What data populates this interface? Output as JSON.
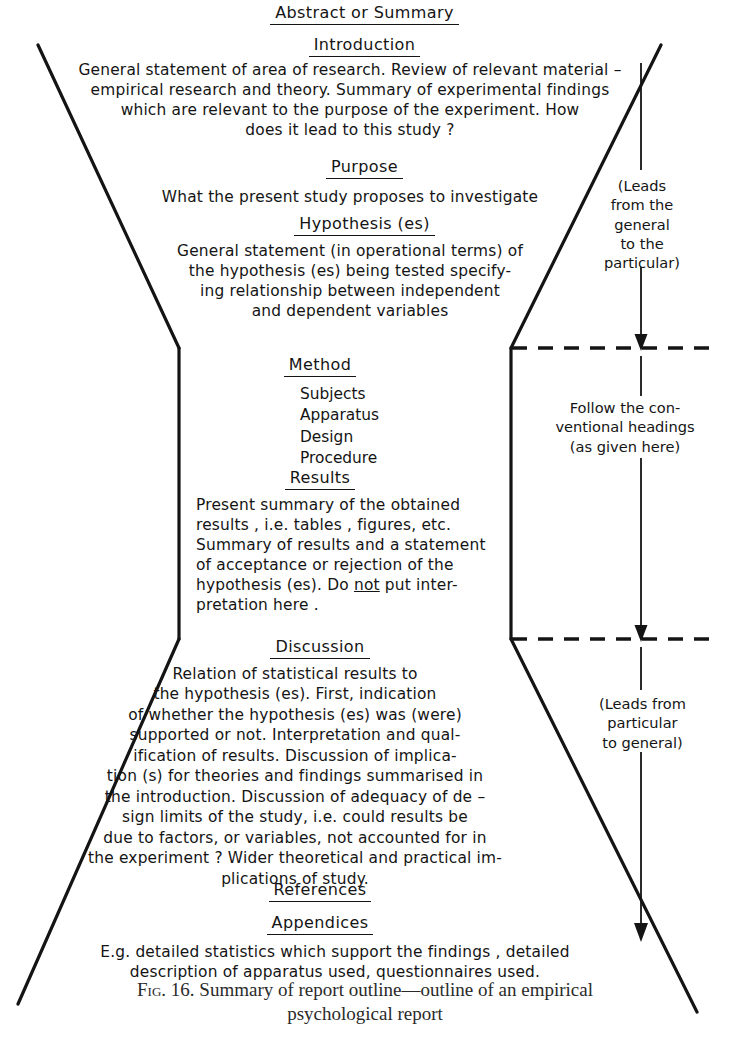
{
  "figure": {
    "title_heading": "Abstract or Summary",
    "sections": [
      {
        "id": "abstract",
        "heading": "Abstract or Summary",
        "body": ""
      },
      {
        "id": "introduction",
        "heading": "Introduction",
        "body": "General statement of area of research. Review of relevant material –\nempirical research and theory. Summary of experimental findings\nwhich are relevant to the purpose of the experiment. How\ndoes it lead to this study ?"
      },
      {
        "id": "purpose",
        "heading": "Purpose",
        "body": "What the present study proposes to investigate"
      },
      {
        "id": "hypothesis",
        "heading": "Hypothesis (es)",
        "body": "General statement (in operational terms) of\nthe hypothesis (es) being tested specify-\ning relationship between independent\nand dependent variables"
      },
      {
        "id": "method",
        "heading": "Method",
        "items": [
          "Subjects",
          "Apparatus",
          "Design",
          "Procedure"
        ]
      },
      {
        "id": "results",
        "heading": "Results",
        "body_before_not": "Present summary of the obtained\nresults , i.e. tables , figures, etc.\nSummary of results and a statement\nof acceptance or rejection of the\nhypothesis (es). Do ",
        "emphasis": "not",
        "body_after_not": " put inter-\npretation here ."
      },
      {
        "id": "discussion",
        "heading": "Discussion",
        "body": "Relation of statistical results to\nthe hypothesis (es). First, indication\nof whether the hypothesis (es) was (were)\nsupported or not. Interpretation and qual-\nification of results. Discussion of implica-\ntion (s) for theories and findings summarised in\nthe introduction. Discussion of adequacy of de –\nsign limits of the study, i.e. could results be\ndue to factors, or variables, not accounted for in\nthe experiment ? Wider theoretical and practical im-\nplications of study."
      },
      {
        "id": "references",
        "heading": "References",
        "body": ""
      },
      {
        "id": "appendices",
        "heading": "Appendices",
        "body": "E.g. detailed statistics which support the findings , detailed\ndescription of apparatus used, questionnaires used."
      }
    ],
    "side_notes": [
      {
        "id": "leads-general-to-particular",
        "text": "(Leads\nfrom the\ngeneral\nto the\nparticular)"
      },
      {
        "id": "follow-conventional-headings",
        "text": "Follow the con-\nventional headings\n(as given here)"
      },
      {
        "id": "leads-particular-to-general",
        "text": "(Leads from\nparticular\nto general)"
      }
    ],
    "caption": {
      "fig_label": "Fig. 16.",
      "text": " Summary of report outline—outline of an empirical\npsychological report"
    },
    "colors": {
      "ink": "#141414",
      "paper": "#ffffff",
      "caption_ink": "#2a2a2a"
    }
  }
}
